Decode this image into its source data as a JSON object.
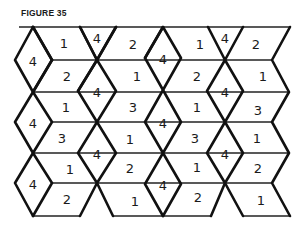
{
  "figure": {
    "title": "FIGURE 35",
    "columns": [
      {
        "id": "A",
        "x": 33,
        "diamonds": [
          {
            "cy": 60,
            "label": "4"
          },
          {
            "cy": 122,
            "label": "4"
          },
          {
            "cy": 183,
            "label": "4"
          }
        ]
      },
      {
        "id": "B",
        "x": 97,
        "top_triangle_label": "4",
        "diamonds": [
          {
            "cy": 91,
            "label": "4"
          },
          {
            "cy": 153,
            "label": "4"
          }
        ]
      },
      {
        "id": "C",
        "x": 163,
        "diamonds": [
          {
            "cy": 58,
            "label": "4"
          },
          {
            "cy": 122,
            "label": "4"
          },
          {
            "cy": 184,
            "label": "4"
          }
        ]
      },
      {
        "id": "D",
        "x": 225,
        "top_triangle_label": "4",
        "diamonds": [
          {
            "cy": 91,
            "label": "4"
          },
          {
            "cy": 153,
            "label": "4"
          }
        ]
      }
    ],
    "parallelograms": {
      "gap_AB": [
        "1",
        "2",
        "1",
        "3",
        "1",
        "2"
      ],
      "gap_BC": [
        "2",
        "1",
        "3",
        "1",
        "2",
        "1"
      ],
      "gap_CD": [
        "1",
        "2",
        "1",
        "3",
        "1",
        "2"
      ],
      "gap_D_right": [
        "2",
        "1",
        "3",
        "1",
        "2",
        "1"
      ]
    }
  }
}
